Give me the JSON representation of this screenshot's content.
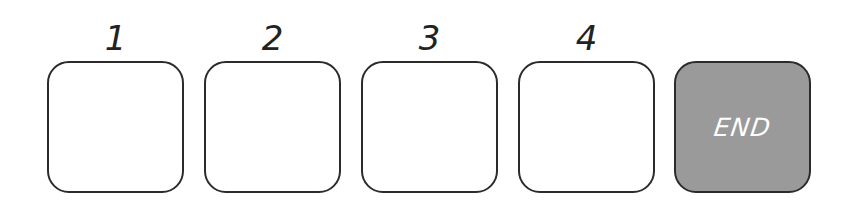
{
  "slots": [
    {
      "label": "1",
      "filled": false
    },
    {
      "label": "2",
      "filled": false
    },
    {
      "label": "3",
      "filled": false
    },
    {
      "label": "4",
      "filled": false
    }
  ],
  "end_box": {
    "label": "END",
    "fill_color": "#9a9a9a",
    "text_color": "#ffffff"
  },
  "colors": {
    "border": "#2b2b2b",
    "background": "#ffffff"
  }
}
